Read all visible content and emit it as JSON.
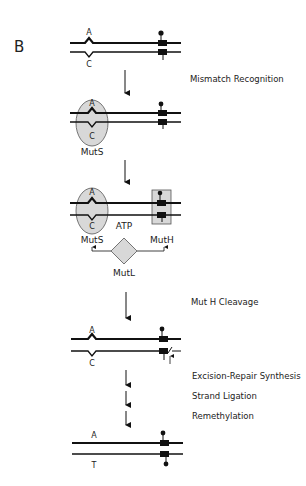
{
  "panel_label": "B",
  "steps": {
    "mismatch_recognition": "Mismatch Recognition",
    "muth_cleavage": "Mut H Cleavage",
    "excision": "Excision-Repair Synthesis",
    "ligation": "Strand Ligation",
    "remethylation": "Remethylation"
  },
  "bases": {
    "top_mismatch": "A",
    "bottom_mismatch": "C",
    "bottom_repaired": "T"
  },
  "proteins": {
    "muts": "MutS",
    "muth": "MutH",
    "mutl": "MutL",
    "atp": "ATP"
  },
  "colors": {
    "protein_fill": "#d8d8d8",
    "line": "#111111"
  }
}
